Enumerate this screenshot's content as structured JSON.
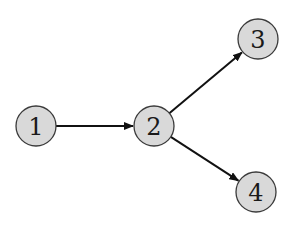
{
  "diagram": {
    "type": "directed-graph",
    "node_style": {
      "fill": "#d9d9d9",
      "stroke": "#3a3a3a",
      "radius": 20
    },
    "edge_style": {
      "color": "#111111",
      "arrowhead": "filled"
    },
    "nodes": [
      {
        "id": "1",
        "label": "1",
        "cx": 36,
        "cy": 126
      },
      {
        "id": "2",
        "label": "2",
        "cx": 154,
        "cy": 126
      },
      {
        "id": "3",
        "label": "3",
        "cx": 258,
        "cy": 39
      },
      {
        "id": "4",
        "label": "4",
        "cx": 256,
        "cy": 192
      }
    ],
    "edges": [
      {
        "from": "1",
        "to": "2"
      },
      {
        "from": "2",
        "to": "3"
      },
      {
        "from": "2",
        "to": "4"
      }
    ]
  }
}
